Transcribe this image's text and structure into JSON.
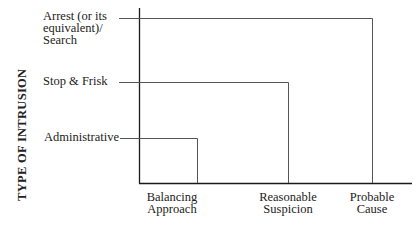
{
  "diagram": {
    "y_axis_label": "TYPE OF INTRUSION",
    "intrusion_levels": [
      {
        "label": "Arrest (or its equivalent)/ Search",
        "lines": [
          "Arrest (or its",
          "equivalent)/",
          "Search"
        ],
        "standard": "Probable Cause"
      },
      {
        "label": "Stop & Frisk",
        "lines": [
          "Stop & Frisk"
        ],
        "standard": "Reasonable Suspicion"
      },
      {
        "label": "Administrative",
        "lines": [
          "Administrative"
        ],
        "standard": "Balancing Approach"
      }
    ],
    "x_axis_categories": [
      {
        "label": "Balancing Approach",
        "lines": [
          "Balancing",
          "Approach"
        ]
      },
      {
        "label": "Reasonable Suspicion",
        "lines": [
          "Reasonable",
          "Suspicion"
        ]
      },
      {
        "label": "Probable Cause",
        "lines": [
          "Probable",
          "Cause"
        ]
      }
    ],
    "colors": {
      "axis": "#1a1a1a",
      "line": "#555555"
    }
  }
}
